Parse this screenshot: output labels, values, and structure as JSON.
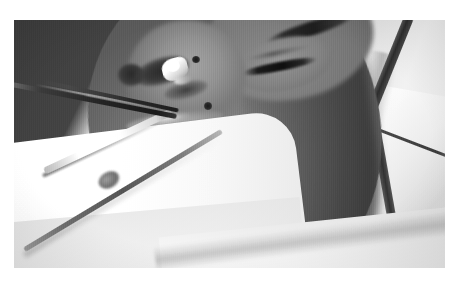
{
  "page": {
    "background_color": "#ffffff",
    "width": 460,
    "height": 284
  },
  "figure": {
    "kind": "clinical-photograph",
    "color_mode": "grayscale",
    "frame": {
      "left": 14,
      "top": 20,
      "width": 431,
      "height": 248
    },
    "regions": {
      "backdrop": "dark gray background, upper left, crossed by a bright diagonal light band",
      "drape_left": "white surgical drape, lower left",
      "drape_right": "white surgical drape folds, right side and behind the head",
      "drape_bottom": "white drape along the lower edge",
      "face": "patient face in three-quarter profile, mid-gray skin tones",
      "eye": "closed eye with dark lashes and eyebrow, right of centre",
      "nose": "nose with shadowed nostril, centre-left",
      "lips": "closed lips with a specular highlight on the upper lip",
      "chin": "chin and jaw shading into shadow at lower centre",
      "tube": "dark tubing or head strap crossing the right drape"
    },
    "annotations": {
      "moles": [
        {
          "name": "mole-upper",
          "note": "small dark nevus on the cheek above the instrument"
        },
        {
          "name": "mole-lower",
          "note": "small dark nevus lateral to the mouth"
        },
        {
          "name": "mole-jaw",
          "note": "faint dark speck on the jaw"
        }
      ],
      "instruments": [
        {
          "name": "nasal-instrument",
          "note": "dark slender instrument shaft entering the nostril"
        },
        {
          "name": "instrument-tip",
          "note": "bright polished metal tip inside the nostril"
        },
        {
          "name": "bright-instrument",
          "note": "polished instrument on the drape, lower left"
        },
        {
          "name": "instrument-handle",
          "note": "long thin handle extending across the white drape"
        }
      ]
    }
  },
  "caption": {
    "text": ""
  }
}
